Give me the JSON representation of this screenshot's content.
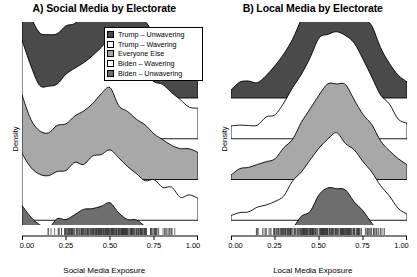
{
  "figure": {
    "background": "#ffffff",
    "width": 417,
    "height": 277
  },
  "legend": {
    "position": "top-right-panel-a",
    "items": [
      {
        "label": "Trump – Unwavering",
        "color": "#4a4a4a"
      },
      {
        "label": "Trump – Wavering",
        "color": "#ffffff"
      },
      {
        "label": "Everyone Else",
        "color": "#a8a8a8"
      },
      {
        "label": "Biden – Wavering",
        "color": "#ffffff"
      },
      {
        "label": "Biden – Unwavering",
        "color": "#6e6e6e"
      }
    ]
  },
  "panels": [
    {
      "id": "A",
      "title": "A) Social Media by Electorate",
      "xlabel": "Social Media Exposure",
      "ylabel": "Density"
    },
    {
      "id": "B",
      "title": "B) Local Media by Electorate",
      "xlabel": "Local Media Exposure",
      "ylabel": "Density"
    }
  ],
  "axis": {
    "ticks": [
      "0.00",
      "0.25",
      "0.50",
      "0.75",
      "1.00"
    ],
    "tick_values": [
      0,
      0.25,
      0.5,
      0.75,
      1.0
    ]
  },
  "chart_data": {
    "type": "area",
    "subtype": "stacked-ridgeline-density",
    "grid": false,
    "legend_position": "upper-right of panel A",
    "xlim": [
      0,
      1
    ],
    "ylabel": "Density",
    "panels": [
      {
        "id": "A",
        "title": "A) Social Media by Electorate",
        "xlabel": "Social Media Exposure",
        "ylabel": "Density",
        "xticks": [
          0,
          0.25,
          0.5,
          0.75,
          1.0
        ],
        "xticklabels": [
          "0.00",
          "0.25",
          "0.50",
          "0.75",
          "1.00"
        ],
        "x": [
          0.0,
          0.05,
          0.1,
          0.15,
          0.2,
          0.25,
          0.3,
          0.35,
          0.4,
          0.45,
          0.5,
          0.55,
          0.6,
          0.65,
          0.7,
          0.75,
          0.8,
          0.85,
          0.9,
          0.95,
          1.0
        ],
        "series": [
          {
            "name": "Trump – Unwavering",
            "color": "#4a4a4a",
            "values": [
              1.0,
              0.72,
              0.55,
              0.52,
              0.56,
              0.6,
              0.66,
              0.7,
              0.78,
              0.86,
              0.93,
              0.8,
              0.72,
              0.66,
              0.62,
              0.56,
              0.5,
              0.44,
              0.38,
              0.33,
              0.3
            ]
          },
          {
            "name": "Trump – Wavering",
            "color": "#ffffff",
            "values": [
              0.82,
              0.6,
              0.47,
              0.45,
              0.49,
              0.53,
              0.58,
              0.62,
              0.7,
              0.78,
              0.86,
              0.74,
              0.66,
              0.6,
              0.55,
              0.49,
              0.43,
              0.38,
              0.33,
              0.28,
              0.25
            ]
          },
          {
            "name": "Everyone Else",
            "color": "#a8a8a8",
            "values": [
              0.7,
              0.52,
              0.42,
              0.41,
              0.46,
              0.5,
              0.55,
              0.58,
              0.64,
              0.7,
              0.76,
              0.64,
              0.56,
              0.5,
              0.45,
              0.4,
              0.35,
              0.31,
              0.27,
              0.23,
              0.21
            ]
          },
          {
            "name": "Biden – Wavering",
            "color": "#ffffff",
            "values": [
              0.58,
              0.44,
              0.36,
              0.36,
              0.4,
              0.44,
              0.48,
              0.5,
              0.54,
              0.58,
              0.62,
              0.52,
              0.45,
              0.4,
              0.36,
              0.32,
              0.28,
              0.25,
              0.22,
              0.19,
              0.17
            ]
          },
          {
            "name": "Biden – Unwavering",
            "color": "#6e6e6e",
            "values": [
              0.45,
              0.35,
              0.29,
              0.29,
              0.33,
              0.36,
              0.39,
              0.41,
              0.44,
              0.47,
              0.5,
              0.42,
              0.36,
              0.32,
              0.29,
              0.26,
              0.23,
              0.2,
              0.18,
              0.16,
              0.14
            ]
          }
        ],
        "rug": true
      },
      {
        "id": "B",
        "title": "B) Local Media by Electorate",
        "xlabel": "Local Media Exposure",
        "ylabel": "Density",
        "xticks": [
          0,
          0.25,
          0.5,
          0.75,
          1.0
        ],
        "xticklabels": [
          "0.00",
          "0.25",
          "0.50",
          "0.75",
          "1.00"
        ],
        "x": [
          0.0,
          0.05,
          0.1,
          0.15,
          0.2,
          0.25,
          0.3,
          0.35,
          0.4,
          0.45,
          0.5,
          0.55,
          0.6,
          0.65,
          0.7,
          0.75,
          0.8,
          0.85,
          0.9,
          0.95,
          1.0
        ],
        "series": [
          {
            "name": "Trump – Unwavering",
            "color": "#4a4a4a",
            "values": [
              0.1,
              0.11,
              0.13,
              0.16,
              0.21,
              0.28,
              0.38,
              0.5,
              0.64,
              0.8,
              0.92,
              0.98,
              1.0,
              0.96,
              0.86,
              0.72,
              0.58,
              0.44,
              0.32,
              0.22,
              0.16
            ]
          },
          {
            "name": "Trump – Wavering",
            "color": "#ffffff",
            "values": [
              0.08,
              0.09,
              0.1,
              0.13,
              0.17,
              0.23,
              0.32,
              0.43,
              0.56,
              0.71,
              0.83,
              0.89,
              0.91,
              0.87,
              0.78,
              0.65,
              0.51,
              0.38,
              0.27,
              0.18,
              0.13
            ]
          },
          {
            "name": "Everyone Else",
            "color": "#a8a8a8",
            "values": [
              0.06,
              0.07,
              0.08,
              0.1,
              0.14,
              0.19,
              0.27,
              0.37,
              0.49,
              0.63,
              0.74,
              0.8,
              0.82,
              0.78,
              0.7,
              0.58,
              0.45,
              0.33,
              0.23,
              0.15,
              0.1
            ]
          },
          {
            "name": "Biden – Wavering",
            "color": "#ffffff",
            "values": [
              0.05,
              0.05,
              0.06,
              0.08,
              0.11,
              0.15,
              0.22,
              0.31,
              0.42,
              0.54,
              0.64,
              0.7,
              0.72,
              0.68,
              0.6,
              0.49,
              0.38,
              0.27,
              0.19,
              0.12,
              0.08
            ]
          },
          {
            "name": "Biden – Unwavering",
            "color": "#6e6e6e",
            "values": [
              0.04,
              0.04,
              0.05,
              0.06,
              0.09,
              0.12,
              0.18,
              0.25,
              0.35,
              0.45,
              0.54,
              0.6,
              0.62,
              0.59,
              0.52,
              0.42,
              0.32,
              0.23,
              0.16,
              0.1,
              0.07
            ]
          }
        ],
        "rug": true
      }
    ]
  }
}
